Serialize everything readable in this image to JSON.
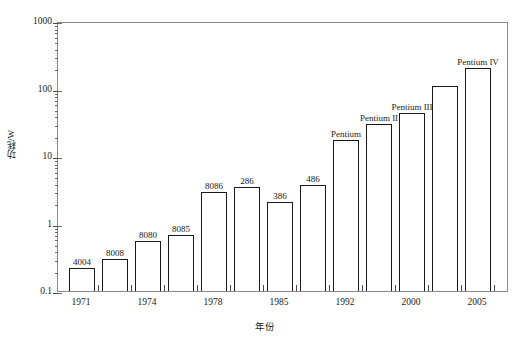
{
  "chart_data": {
    "type": "bar",
    "title": "",
    "subtitle": "",
    "xlabel": "年份",
    "ylabel": "功耗/W",
    "yscale": "log",
    "ylim": [
      0.1,
      1000
    ],
    "y_tick_labels": [
      "0.1",
      "1",
      "10",
      "100",
      "1000"
    ],
    "y_tick_values": [
      0.1,
      1,
      10,
      100,
      1000
    ],
    "grid": false,
    "legend": false,
    "x_tick_labels": [
      "1971",
      "1974",
      "1978",
      "1985",
      "1992",
      "2000",
      "2005"
    ],
    "x_axis_note": "minor ticks between labelled years; bars sit between ticks",
    "categories": [
      "4004",
      "8008",
      "8080",
      "8085",
      "8086",
      "286",
      "386",
      "486",
      "Pentium",
      "Pentium II",
      "Pentium III",
      "",
      "Pentium IV"
    ],
    "values": [
      0.22,
      0.3,
      0.55,
      0.68,
      2.9,
      3.5,
      2.1,
      3.7,
      17,
      30,
      44,
      110,
      200
    ],
    "value_unit": "W",
    "bar_labels": [
      "4004",
      "8008",
      "8080",
      "8085",
      "8086",
      "286",
      "386",
      "486",
      "Pentium",
      "Pentium II",
      "Pentium III",
      "",
      "Pentium IV"
    ]
  },
  "bars": [
    {
      "label": "4004",
      "value": 0.22,
      "x_center": 81,
      "width": 26
    },
    {
      "label": "8008",
      "value": 0.3,
      "x_center": 114,
      "width": 26
    },
    {
      "label": "8080",
      "value": 0.55,
      "x_center": 147,
      "width": 26
    },
    {
      "label": "8085",
      "value": 0.68,
      "x_center": 180,
      "width": 26
    },
    {
      "label": "8086",
      "value": 2.9,
      "x_center": 213,
      "width": 26
    },
    {
      "label": "286",
      "value": 3.5,
      "x_center": 246,
      "width": 26
    },
    {
      "label": "386",
      "value": 2.1,
      "x_center": 279,
      "width": 26
    },
    {
      "label": "486",
      "value": 3.7,
      "x_center": 312,
      "width": 26
    },
    {
      "label": "Pentium",
      "value": 17,
      "x_center": 345,
      "width": 26
    },
    {
      "label": "Pentium II",
      "value": 30,
      "x_center": 378,
      "width": 26
    },
    {
      "label": "Pentium III",
      "value": 44,
      "x_center": 411,
      "width": 26
    },
    {
      "label": "",
      "value": 110,
      "x_center": 444,
      "width": 26
    },
    {
      "label": "Pentium IV",
      "value": 200,
      "x_center": 477,
      "width": 26
    }
  ],
  "x_ticks": [
    {
      "label": "1971",
      "x": 81
    },
    {
      "label": "",
      "x": 97
    },
    {
      "label": "",
      "x": 114
    },
    {
      "label": "",
      "x": 130
    },
    {
      "label": "1974",
      "x": 147
    },
    {
      "label": "",
      "x": 163
    },
    {
      "label": "",
      "x": 180
    },
    {
      "label": "",
      "x": 196
    },
    {
      "label": "1978",
      "x": 213
    },
    {
      "label": "",
      "x": 229
    },
    {
      "label": "",
      "x": 246
    },
    {
      "label": "",
      "x": 262
    },
    {
      "label": "1985",
      "x": 279
    },
    {
      "label": "",
      "x": 295
    },
    {
      "label": "",
      "x": 312
    },
    {
      "label": "",
      "x": 328
    },
    {
      "label": "1992",
      "x": 345
    },
    {
      "label": "",
      "x": 361
    },
    {
      "label": "",
      "x": 378
    },
    {
      "label": "",
      "x": 394
    },
    {
      "label": "2000",
      "x": 411
    },
    {
      "label": "",
      "x": 427
    },
    {
      "label": "",
      "x": 444
    },
    {
      "label": "",
      "x": 460
    },
    {
      "label": "2005",
      "x": 477
    },
    {
      "label": "",
      "x": 493
    }
  ],
  "axis_titles": {
    "y": "功耗/W",
    "x": "年份"
  },
  "colors": {
    "bar_outline": "#1a1a1a",
    "bar_fill": "#ffffff",
    "frame": "#8a8a8a",
    "text": "#1a1a1a",
    "background": "#ffffff"
  }
}
